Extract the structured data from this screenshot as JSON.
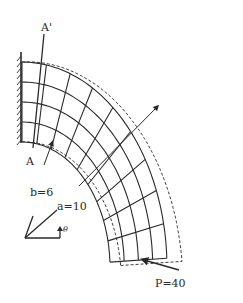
{
  "figure": {
    "labels": {
      "section_top": "A'",
      "section_bottom": "A",
      "inner_radius": "b=6",
      "outer_radius": "a=10",
      "angle": "θ",
      "load": "P=40"
    },
    "parameters": {
      "a": 10,
      "b": 6,
      "P": 40
    },
    "mesh": {
      "radial_divisions": 4,
      "circumferential_divisions": 9
    },
    "colors": {
      "ink": "#2a2a2a",
      "background": "#ffffff"
    }
  }
}
